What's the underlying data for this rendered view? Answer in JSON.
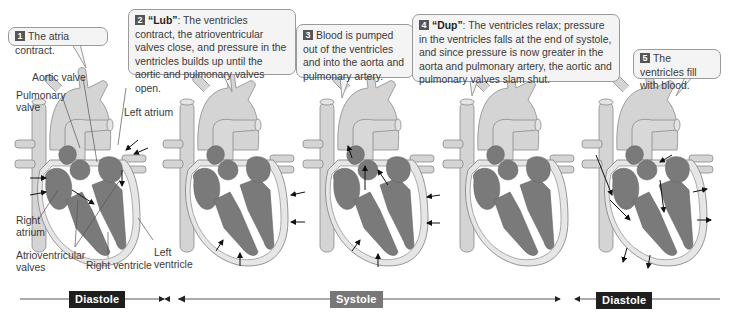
{
  "colors": {
    "heart_light": "#d4d4d4",
    "heart_dark": "#7a7a7a",
    "outline": "#8a8a8a",
    "callout_bg": "#f4f4f4",
    "diastole_badge": "#1e1e1e",
    "systole_badge": "#777777"
  },
  "steps": [
    {
      "num": "1",
      "bold": "",
      "text": "The atria contract."
    },
    {
      "num": "2",
      "bold": "“Lub”",
      "text": ": The ventricles contract, the atrioventricular valves close, and pressure in the ventricles builds up until the aortic and pulmonary valves open."
    },
    {
      "num": "3",
      "bold": "",
      "text": "Blood is pumped out of the ventricles and into the aorta and pulmonary artery."
    },
    {
      "num": "4",
      "bold": "“Dup”",
      "text": ": The ventricles relax; pressure in the ventricles falls at the end of systole, and since pressure is now greater in the aorta and pulmonary artery, the aortic and pulmonary valves slam shut."
    },
    {
      "num": "5",
      "bold": "",
      "text": "The ventricles fill with blood."
    }
  ],
  "labels": {
    "aortic_valve": "Aortic valve",
    "pulmonary_valve": "Pulmonary valve",
    "left_atrium": "Left atrium",
    "right_atrium": "Right atrium",
    "av_valves": "Atrioventricular valves",
    "right_ventricle": "Right ventricle",
    "left_ventricle": "Left ventricle"
  },
  "timeline": {
    "phases": [
      {
        "label": "Diastole"
      },
      {
        "label": "Systole"
      },
      {
        "label": "Diastole"
      }
    ]
  }
}
